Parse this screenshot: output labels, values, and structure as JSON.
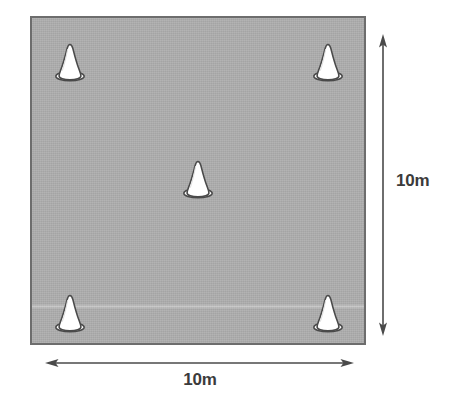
{
  "diagram": {
    "field": {
      "shape": "square",
      "fill_color": "#acacac",
      "border_color": "#6d6d6d",
      "width_label": "10m",
      "height_label": "10m"
    },
    "cones": [
      {
        "id": "cone-top-left",
        "position": "top-left",
        "x_pct": 11.3,
        "y_pct": 13.4,
        "color": "#ffffff",
        "outline_color": "#4a4a4a"
      },
      {
        "id": "cone-top-right",
        "position": "top-right",
        "x_pct": 89.3,
        "y_pct": 13.4,
        "color": "#ffffff",
        "outline_color": "#4a4a4a"
      },
      {
        "id": "cone-center",
        "position": "center",
        "x_pct": 50.0,
        "y_pct": 49.5,
        "color": "#ffffff",
        "outline_color": "#4a4a4a"
      },
      {
        "id": "cone-bottom-left",
        "position": "bottom-left",
        "x_pct": 11.3,
        "y_pct": 90.9,
        "color": "#ffffff",
        "outline_color": "#4a4a4a"
      },
      {
        "id": "cone-bottom-right",
        "position": "bottom-right",
        "x_pct": 89.3,
        "y_pct": 90.9,
        "color": "#ffffff",
        "outline_color": "#4a4a4a"
      }
    ],
    "dimensions": {
      "vertical": {
        "label": "10m",
        "orientation": "vertical",
        "arrow_style": "double-headed",
        "line_color": "#4a4a4a"
      },
      "horizontal": {
        "label": "10m",
        "orientation": "horizontal",
        "arrow_style": "double-headed",
        "line_color": "#4a4a4a"
      }
    },
    "label_color": "#3b3b3b"
  }
}
